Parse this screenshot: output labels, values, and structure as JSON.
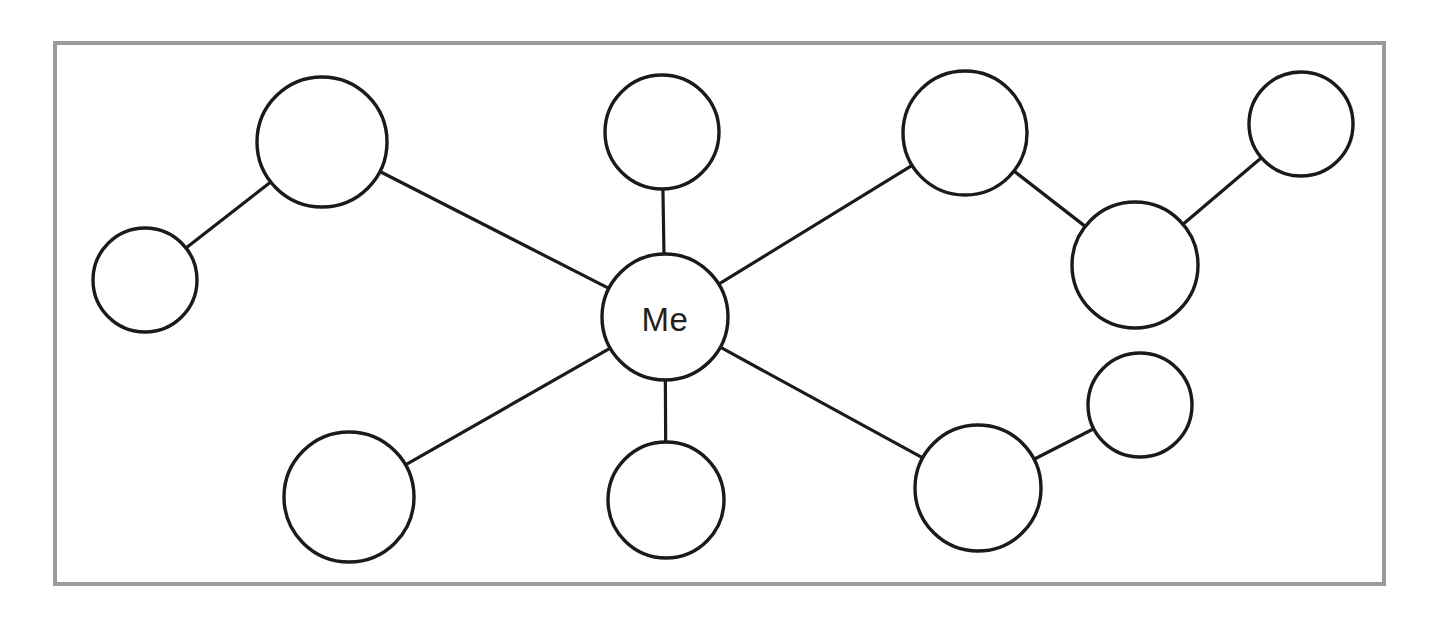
{
  "worksheet": {
    "title": "Social Network Web Diagram",
    "background_color": "#ffffff",
    "frame": {
      "name": "diagram-frame",
      "border_color": "#9a9a9a",
      "border_width_px": 4,
      "x": 53,
      "y": 41,
      "width": 1333,
      "height": 545,
      "fill": "#ffffff"
    }
  },
  "diagram": {
    "type": "node-link-web",
    "stroke_color": "#1a1a1a",
    "node_fill": "#ffffff",
    "node_stroke_width": 3.4,
    "edge_stroke_width": 3.2,
    "nodes": [
      {
        "id": "me",
        "label": "Me",
        "cx": 665,
        "cy": 317,
        "r": 63,
        "has_label": true
      },
      {
        "id": "n-upleft",
        "label": "",
        "cx": 322,
        "cy": 142,
        "r": 65,
        "has_label": false
      },
      {
        "id": "n-farleft",
        "label": "",
        "cx": 145,
        "cy": 280,
        "r": 52,
        "has_label": false
      },
      {
        "id": "n-top",
        "label": "",
        "cx": 662,
        "cy": 132,
        "r": 57,
        "has_label": false
      },
      {
        "id": "n-upright",
        "label": "",
        "cx": 965,
        "cy": 133,
        "r": 62,
        "has_label": false
      },
      {
        "id": "n-midright",
        "label": "",
        "cx": 1135,
        "cy": 265,
        "r": 63,
        "has_label": false
      },
      {
        "id": "n-farright",
        "label": "",
        "cx": 1301,
        "cy": 124,
        "r": 52,
        "has_label": false
      },
      {
        "id": "n-lowleft",
        "label": "",
        "cx": 349,
        "cy": 497,
        "r": 65,
        "has_label": false
      },
      {
        "id": "n-bottom",
        "label": "",
        "cx": 666,
        "cy": 500,
        "r": 58,
        "has_label": false
      },
      {
        "id": "n-lowright",
        "label": "",
        "cx": 978,
        "cy": 488,
        "r": 63,
        "has_label": false
      },
      {
        "id": "n-botright",
        "label": "",
        "cx": 1140,
        "cy": 405,
        "r": 52,
        "has_label": false
      }
    ],
    "edges": [
      {
        "from": "me",
        "to": "n-upleft"
      },
      {
        "from": "me",
        "to": "n-top"
      },
      {
        "from": "me",
        "to": "n-upright"
      },
      {
        "from": "me",
        "to": "n-lowleft"
      },
      {
        "from": "me",
        "to": "n-bottom"
      },
      {
        "from": "me",
        "to": "n-lowright"
      },
      {
        "from": "n-upleft",
        "to": "n-farleft"
      },
      {
        "from": "n-upright",
        "to": "n-midright"
      },
      {
        "from": "n-midright",
        "to": "n-farright"
      },
      {
        "from": "n-lowright",
        "to": "n-botright"
      }
    ],
    "center_node_id": "me",
    "center_label": "Me",
    "node_count": 11,
    "edge_count": 10
  }
}
